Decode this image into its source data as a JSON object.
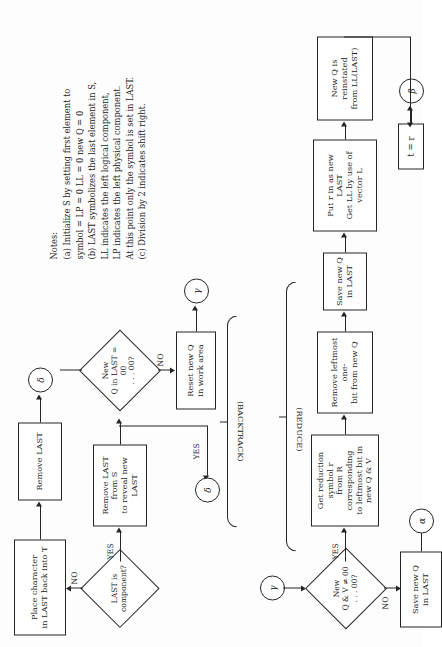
{
  "figure": {
    "orientation": "rotated-90-ccw",
    "ink_color": "#252525",
    "paper_color": "#fdfdfd"
  },
  "nodes": {
    "place_character": "Place character\nin LAST back into T",
    "remove_last": "Remove LAST",
    "remove_last_from_s": "Remove LAST from S\nto reveal new LAST",
    "reset_new_q": "Reset new Q\nin work area",
    "save_new_q_in_last": "Save new Q\nin LAST",
    "get_reduction_symbol": "Get reduction symbol r\nfrom R corresponding\nto leftmost bit in\nnew Q & V",
    "remove_leftmost_one_bit": "Remove leftmost one-\nbit from new Q",
    "save_new_q_in_last_2": "Save new Q in LAST",
    "put_r_in_as_new_last": "Put r in as new LAST\nGet LL by use of\nvector L",
    "new_q_reinstated": "New Q is reinstated\nfrom LL(LAST)",
    "t_equals_r": "t = r"
  },
  "decisions": {
    "last_is_component": "LAST is\ncomponent?",
    "new_q_in_last_zero": "New\nQ in LAST = 00\n. . . 00?",
    "new_q_and_v": "New\nQ & V ≠ 00\n. . . 00?"
  },
  "connectors": {
    "delta_top": "δ",
    "gamma_top": "γ",
    "gamma_mid": "γ",
    "delta_mid": "δ",
    "alpha": "α",
    "beta": "β"
  },
  "branch_labels": {
    "no_1": "NO",
    "yes_1": "YES",
    "no_2": "NO",
    "yes_2": "YES",
    "no_3": "NO",
    "yes_3": "YES"
  },
  "group_labels": {
    "backtrack": "(BACKTRACK)",
    "reduce": "(REDUCE)"
  },
  "notes": {
    "heading": "Notes:",
    "lines": [
      "(a)   Initialize S by setting first element to",
      "symbol =    LP = 0   LL = 0    new Q = 0",
      "(b)    LAST symbolizes the last element in S,",
      "LL indicates the left logical component,",
      "LP indicates the left physical component.",
      "At this point only the symbol is set in LAST.",
      "(c)    Division by 2 indicates shift right."
    ]
  }
}
